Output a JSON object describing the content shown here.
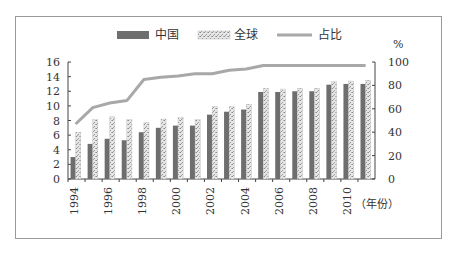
{
  "chart_data": {
    "type": "bar+line",
    "title": "",
    "categories": [
      "1994",
      "1995",
      "1996",
      "1997",
      "1998",
      "1999",
      "2000",
      "2001",
      "2002",
      "2003",
      "2004",
      "2005",
      "2006",
      "2007",
      "2008",
      "2009",
      "2010",
      "2011"
    ],
    "x_tick_labels": [
      "1994",
      "1996",
      "1998",
      "2000",
      "2002",
      "2004",
      "2006",
      "2008",
      "2010"
    ],
    "xlabel": "（年份）",
    "ylabel_left": "",
    "ylabel_right": "%",
    "ylim_left": [
      0,
      16
    ],
    "yticks_left": [
      0,
      2,
      4,
      6,
      8,
      10,
      12,
      14,
      16
    ],
    "ylim_right": [
      0,
      100
    ],
    "yticks_right": [
      0,
      20,
      40,
      60,
      80,
      100
    ],
    "grid": false,
    "legend_position": "top",
    "series": [
      {
        "name": "中国",
        "type": "bar",
        "axis": "left",
        "color": "#6e6e6e",
        "values": [
          3.0,
          4.8,
          5.5,
          5.3,
          6.4,
          7.0,
          7.3,
          7.3,
          8.8,
          9.2,
          9.5,
          11.9,
          11.9,
          12.0,
          12.0,
          12.9,
          13.0,
          13.0
        ]
      },
      {
        "name": "全球",
        "type": "bar",
        "axis": "left",
        "color": "#d9d9d9",
        "pattern": "speckled",
        "values": [
          6.4,
          8.1,
          8.5,
          8.1,
          7.7,
          8.2,
          8.4,
          8.1,
          9.9,
          9.9,
          10.2,
          12.4,
          12.3,
          12.4,
          12.4,
          13.3,
          13.4,
          13.5
        ]
      },
      {
        "name": "占比",
        "type": "line",
        "axis": "right",
        "color": "#a8a8a8",
        "values": [
          47,
          61,
          65,
          67,
          85,
          87,
          88,
          90,
          90,
          93,
          94,
          97,
          97,
          97,
          97,
          97,
          97,
          97
        ]
      }
    ]
  },
  "legend": {
    "china": "中国",
    "global": "全球",
    "share": "占比"
  },
  "axes": {
    "right_unit": "%",
    "x_unit": "（年份）"
  }
}
